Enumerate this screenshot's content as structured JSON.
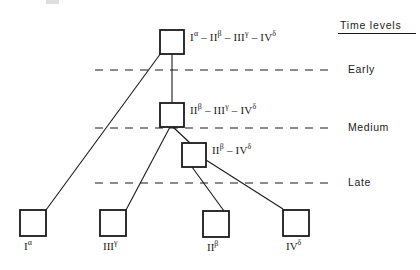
{
  "figure": {
    "type": "tree-diagram",
    "background_color": "#ffffff",
    "line_color": "#1a1a1a",
    "header": {
      "label": "Time levels",
      "underlined": true
    },
    "time_levels": [
      {
        "id": "early",
        "label": "Early",
        "dash_y": 70,
        "dash_x_start": 95,
        "dash_x_end": 330
      },
      {
        "id": "medium",
        "label": "Medium",
        "dash_y": 128,
        "dash_x_start": 95,
        "dash_x_end": 330
      },
      {
        "id": "late",
        "label": "Late",
        "dash_y": 183,
        "dash_x_start": 95,
        "dash_x_end": 330
      }
    ],
    "internal_nodes": [
      {
        "id": "node-root",
        "label_html": "I<sup>&#945;</sup> – II<sup>&#946;</sup> – III<sup>&#947;</sup> – IV<sup>&#948;</sup>",
        "label_text": "Iα - IIβ - IIIγ - IVδ",
        "x": 160,
        "y": 30,
        "w": 24,
        "h": 24
      },
      {
        "id": "node-second",
        "label_html": "II<sup>&#946;</sup> – III<sup>&#947;</sup> – IV<sup>&#948;</sup>",
        "label_text": "IIβ - IIIγ - IVδ",
        "x": 160,
        "y": 103,
        "w": 24,
        "h": 24
      },
      {
        "id": "node-third",
        "label_html": "II<sup>&#946;</sup> – IV<sup>&#948;</sup>",
        "label_text": "IIβ - IVδ",
        "x": 182,
        "y": 143,
        "w": 24,
        "h": 24
      }
    ],
    "leaf_nodes": [
      {
        "id": "leaf-1-alpha",
        "label_html": "I<sup>&#945;</sup>",
        "label_text": "Iα",
        "x": 20,
        "y": 210,
        "w": 26,
        "h": 26
      },
      {
        "id": "leaf-3-gamma",
        "label_html": "III<sup>&#947;</sup>",
        "label_text": "IIIγ",
        "x": 100,
        "y": 210,
        "w": 26,
        "h": 26
      },
      {
        "id": "leaf-2-beta",
        "label_html": "II<sup>&#946;</sup>",
        "label_text": "IIβ",
        "x": 203,
        "y": 211,
        "w": 26,
        "h": 26
      },
      {
        "id": "leaf-4-delta",
        "label_html": "IV<sup>&#948;</sup>",
        "label_text": "IVδ",
        "x": 283,
        "y": 210,
        "w": 26,
        "h": 26
      }
    ],
    "edges": [
      {
        "id": "edge-root-to-leaf1",
        "from": "node-root",
        "to": "leaf-1-alpha",
        "x1": 161,
        "y1": 53,
        "x2": 46,
        "y2": 210
      },
      {
        "id": "edge-root-to-second",
        "from": "node-root",
        "to": "node-second",
        "x1": 172,
        "y1": 54,
        "x2": 172,
        "y2": 103
      },
      {
        "id": "edge-second-to-leaf3",
        "from": "node-second",
        "to": "leaf-3-gamma",
        "x1": 170,
        "y1": 127,
        "x2": 126,
        "y2": 210
      },
      {
        "id": "edge-second-to-third",
        "from": "node-second",
        "to": "node-third",
        "x1": 173,
        "y1": 127,
        "x2": 190,
        "y2": 143
      },
      {
        "id": "edge-third-to-leaf2",
        "from": "node-third",
        "to": "leaf-2-beta",
        "x1": 192,
        "y1": 167,
        "x2": 224,
        "y2": 211
      },
      {
        "id": "edge-third-to-leaf4",
        "from": "node-third",
        "to": "leaf-4-delta",
        "x1": 206,
        "y1": 160,
        "x2": 283,
        "y2": 209
      }
    ]
  }
}
